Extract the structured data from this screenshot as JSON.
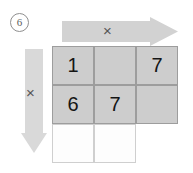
{
  "figure": {
    "step_label": "6",
    "multiply_symbol": "×"
  },
  "arrows": {
    "horizontal": {
      "icon": "right-arrow-icon",
      "direction": "right",
      "operator": "×",
      "color": "#d2d2d2"
    },
    "vertical": {
      "icon": "down-arrow-icon",
      "direction": "down",
      "operator": "×",
      "color": "#d9d9d9"
    }
  },
  "grid": {
    "rows": 3,
    "columns": 3,
    "shaded_color": "#cdcdcd",
    "blank_color": "#fdfdfd",
    "border_color": "#9d9d9d",
    "cells": [
      [
        {
          "value": "1",
          "state": "shaded"
        },
        {
          "value": "",
          "state": "shaded"
        },
        {
          "value": "7",
          "state": "shaded"
        }
      ],
      [
        {
          "value": "6",
          "state": "shaded"
        },
        {
          "value": "7",
          "state": "shaded"
        },
        {
          "value": "",
          "state": "shaded"
        }
      ],
      [
        {
          "value": "",
          "state": "blank"
        },
        {
          "value": "",
          "state": "blank"
        },
        {
          "value": "",
          "state": "void"
        }
      ]
    ]
  }
}
